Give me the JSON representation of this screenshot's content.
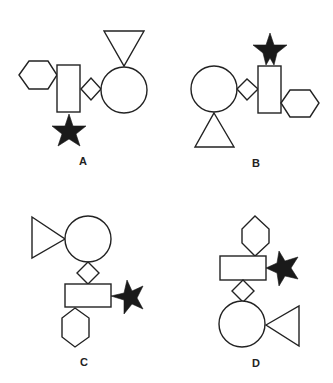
{
  "figures": [
    {
      "label": "A",
      "shapes": [
        "hexagon",
        "rectangle",
        "star",
        "diamond",
        "circle",
        "triangle"
      ]
    },
    {
      "label": "B",
      "shapes": [
        "circle",
        "triangle",
        "diamond",
        "rectangle",
        "star",
        "hexagon"
      ]
    },
    {
      "label": "C",
      "shapes": [
        "triangle",
        "circle",
        "diamond",
        "rectangle",
        "star",
        "hexagon"
      ]
    },
    {
      "label": "D",
      "shapes": [
        "hexagon",
        "rectangle",
        "star",
        "diamond",
        "circle",
        "triangle"
      ]
    }
  ],
  "colors": {
    "outline": "#222222",
    "star_fill": "#1a1a1a",
    "background": "#ffffff"
  }
}
